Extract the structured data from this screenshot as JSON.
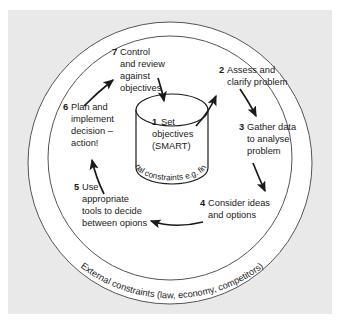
{
  "figure": {
    "background_color": "#e9e9e9",
    "circle_fill": "#ffffff",
    "stroke_color": "#1a1a1a",
    "text_color": "#1a1a1a"
  },
  "center": {
    "number": "1",
    "lines": [
      "Set",
      "objectives",
      "(SMART)"
    ],
    "label_full": "1 Set objectives (SMART)",
    "curved_label": "Internal constraints e.g. finance"
  },
  "outer_ring": {
    "curved_label": "External constraints (law, economy, competitors)"
  },
  "steps": [
    {
      "number": "2",
      "lines": [
        "Assess and",
        "clarify problem"
      ],
      "label_full": "2 Assess and clarify problem"
    },
    {
      "number": "3",
      "lines": [
        "Gather data",
        "to analyse",
        "problem"
      ],
      "label_full": "3 Gather data to analyse problem"
    },
    {
      "number": "4",
      "lines": [
        "Consider ideas",
        "and options"
      ],
      "label_full": "4 Consider ideas and options"
    },
    {
      "number": "5",
      "lines": [
        "Use",
        "appropriate",
        "tools to decide",
        "between opions"
      ],
      "label_full": "5 Use appropriate tools to decide between opions"
    },
    {
      "number": "6",
      "lines": [
        "Plan and",
        "implement",
        "decision –",
        "action!"
      ],
      "label_full": "6 Plan and implement decision – action!"
    },
    {
      "number": "7",
      "lines": [
        "Control",
        "and review",
        "against",
        "objectives"
      ],
      "label_full": "7 Control and review against objectives"
    }
  ]
}
